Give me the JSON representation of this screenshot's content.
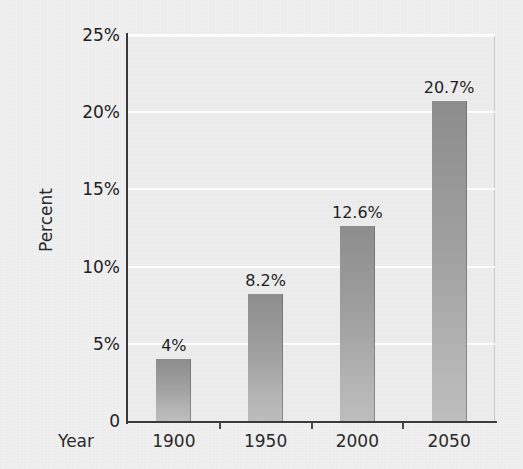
{
  "chart_data": {
    "type": "bar",
    "title": "",
    "xlabel": "Year",
    "ylabel": "Percent",
    "categories": [
      "1900",
      "1950",
      "2000",
      "2050"
    ],
    "values": [
      4,
      8.2,
      12.6,
      20.7
    ],
    "value_labels": [
      "4%",
      "8.2%",
      "12.6%",
      "20.7%"
    ],
    "ylim": [
      0,
      25
    ],
    "ytick_values": [
      0,
      5,
      10,
      15,
      20,
      25
    ],
    "ytick_labels": [
      "0",
      "5%",
      "10%",
      "15%",
      "20%",
      "25%"
    ],
    "grid": "horizontal",
    "legend": "none",
    "series": [
      {
        "name": "Percent",
        "values": [
          4,
          8.2,
          12.6,
          20.7
        ]
      }
    ]
  },
  "axes": {
    "y_title": "Percent",
    "x_title": "Year"
  },
  "colors": {
    "figure_background": "#f1f1f1",
    "plot_background": "#ededed",
    "gridline": "#fcfcfc",
    "axis_line": "#3a3a3a",
    "bar_top": "#8d8d8d",
    "bar_bottom": "#bdbdbd",
    "text": "#222222"
  }
}
